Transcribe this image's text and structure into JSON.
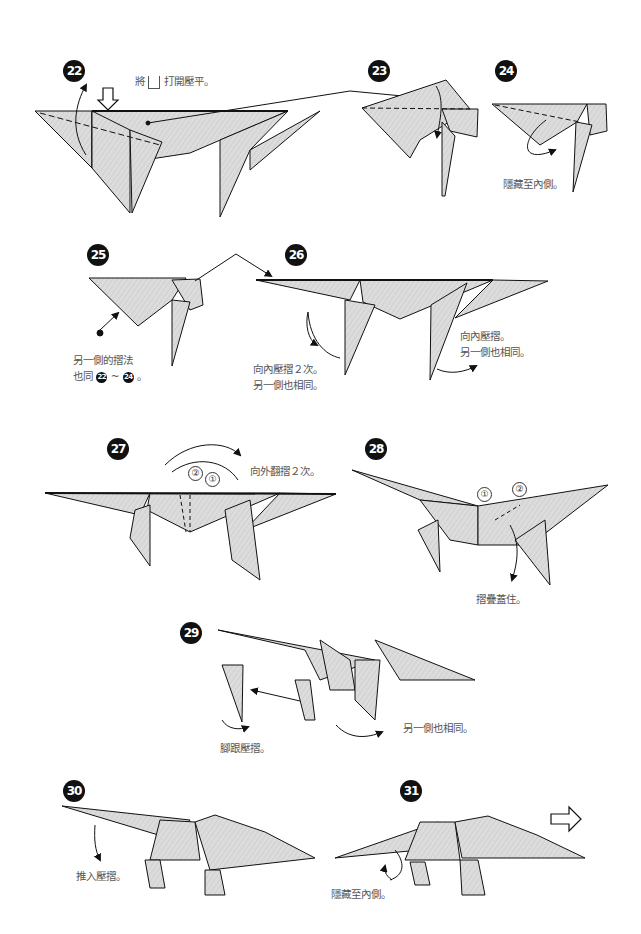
{
  "colors": {
    "paper_fill": "#dcdcdc",
    "line": "#111111",
    "text": "#555555",
    "badge": "#111111"
  },
  "steps": [
    {
      "number": "22",
      "captions": [
        "將",
        "打開壓平。"
      ],
      "icon": "hollow-down-arrow-icon"
    },
    {
      "number": "23",
      "captions": []
    },
    {
      "number": "24",
      "captions": [
        "隱藏至內側。"
      ]
    },
    {
      "number": "25",
      "captions": [
        "另一側的摺法",
        "也同",
        "22",
        "~",
        "24",
        "。"
      ]
    },
    {
      "number": "26",
      "captions": [
        "向內壓摺２次。",
        "另一側也相同。",
        "向內壓摺。",
        "另一側也相同。"
      ]
    },
    {
      "number": "27",
      "captions": [
        "向外翻摺２次。"
      ],
      "markers": [
        "②",
        "①"
      ]
    },
    {
      "number": "28",
      "captions": [
        "摺疊蓋住。"
      ],
      "markers": [
        "①",
        "②"
      ]
    },
    {
      "number": "29",
      "captions": [
        "腳跟壓摺。",
        "另一側也相同。"
      ]
    },
    {
      "number": "30",
      "captions": [
        "推入壓摺。"
      ]
    },
    {
      "number": "31",
      "captions": [
        "隱藏至內側。"
      ],
      "icon": "hollow-right-arrow-icon"
    }
  ]
}
